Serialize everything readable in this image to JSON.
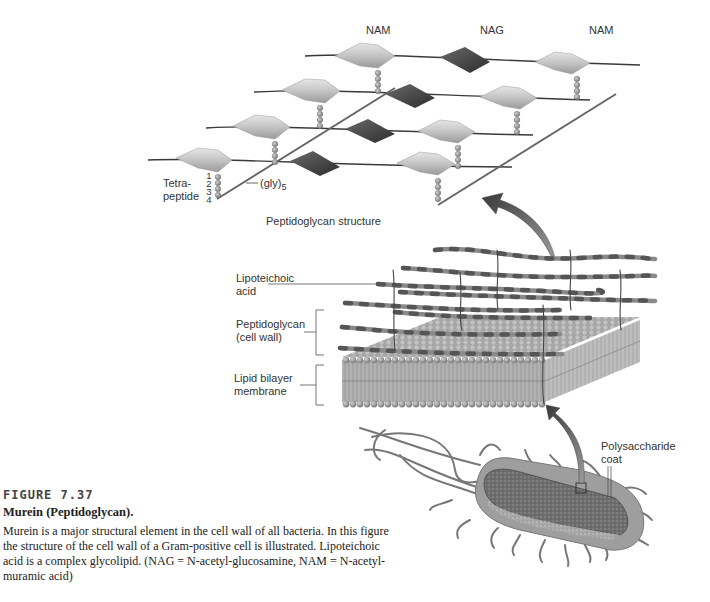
{
  "diagram": {
    "sugar_labels": [
      "NAM",
      "NAG",
      "NAM"
    ],
    "lattice_labels": {
      "tetrapeptide": "Tetra-\npeptide",
      "tetrapeptide_numbers": [
        "1",
        "2",
        "3",
        "4"
      ],
      "glycine_bridge": "(gly)",
      "glycine_bridge_subscript": "5",
      "structure_caption": "Peptidoglycan structure"
    },
    "membrane_labels": {
      "lipoteichoic_acid": "Lipoteichoic\nacid",
      "peptidoglycan": "Peptidoglycan\n(cell wall)",
      "lipid_bilayer": "Lipid bilayer\nmembrane"
    },
    "bacterium_labels": {
      "polysaccharide_coat": "Polysaccharide\ncoat"
    },
    "colors": {
      "nam_sugar": "#b8b8b8",
      "nag_sugar": "#4a4a4a",
      "glycan_strand": "#3a3a3a",
      "peptide_bead": "#8a8a8a",
      "membrane_head": "#9a9a9a",
      "arrow": "#555555"
    }
  },
  "caption": {
    "figure_number": "FIGURE 7.37",
    "title": "Murein (Peptidoglycan).",
    "body": "Murein is a major structural element in the cell wall of all bacteria. In this figure the structure of the cell wall of a Gram-positive cell is illustrated. Lipoteichoic acid is a complex glycolipid. (NAG = N-acetyl-glucosamine, NAM = N-acetyl-muramic acid)"
  }
}
